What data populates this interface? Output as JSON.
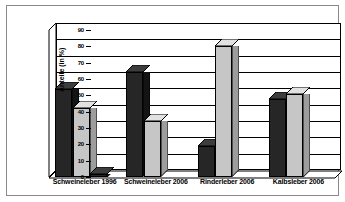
{
  "chart_data": {
    "type": "bar",
    "title": "",
    "subtitle": "",
    "xlabel": "",
    "ylabel": "Anteile (in %)",
    "ylim": [
      0,
      90
    ],
    "ytick_step": 10,
    "yticks": [
      0,
      10,
      20,
      30,
      40,
      50,
      60,
      70,
      80,
      90
    ],
    "grid": true,
    "legend": "none",
    "style": "3d-grouped-columns",
    "categories": [
      "Schweineleber 1996",
      "Schweineleber 2006",
      "Rinderleber 2006",
      "Kalbsleber 2006"
    ],
    "series": [
      {
        "name": "dark",
        "color": "#262626",
        "values": [
          54,
          64,
          19,
          48
        ]
      },
      {
        "name": "light",
        "color": "#c6c6c6",
        "values": [
          42,
          34,
          80,
          51
        ]
      },
      {
        "name": "third",
        "color": "#262626",
        "values": [
          2,
          0,
          0,
          0
        ]
      }
    ],
    "colors": {
      "dark_series": "#262626",
      "light_series": "#c6c6c6",
      "axis": "#000000",
      "plot_background": "#ffffff",
      "frame": "#8a8a8a"
    }
  }
}
